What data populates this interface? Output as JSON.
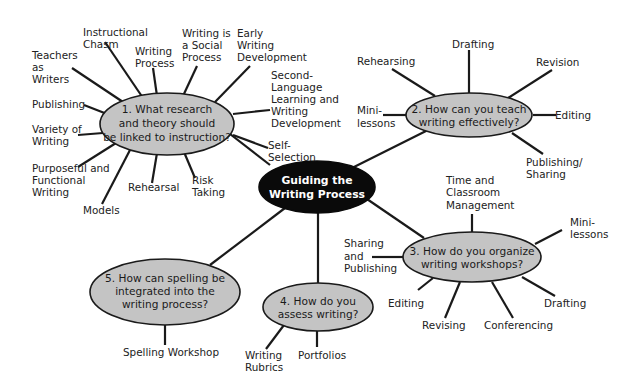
{
  "hub": {
    "line1": "Guiding the",
    "line2": "Writing Process",
    "color": "#0a0a0a"
  },
  "questions": [
    {
      "id": 1,
      "lines": [
        "1.  What research",
        "and theory should",
        "be linked to instruction?"
      ],
      "subtopics": [
        {
          "lines": [
            "Instructional",
            "Chasm"
          ]
        },
        {
          "lines": [
            "Writing",
            "Process"
          ]
        },
        {
          "lines": [
            "Writing is",
            "a Social",
            "Process"
          ]
        },
        {
          "lines": [
            "Early",
            "Writing",
            "Development"
          ]
        },
        {
          "lines": [
            "Teachers",
            "as",
            "Writers"
          ]
        },
        {
          "lines": [
            "Second-",
            "Language",
            "Learning and",
            "Writing",
            "Development"
          ]
        },
        {
          "lines": [
            "Publishing"
          ]
        },
        {
          "lines": [
            "Variety of",
            "Writing"
          ]
        },
        {
          "lines": [
            "Self-",
            "Selection"
          ]
        },
        {
          "lines": [
            "Purposeful and",
            "Functional",
            "Writing"
          ]
        },
        {
          "lines": [
            "Rehearsal"
          ]
        },
        {
          "lines": [
            "Risk",
            "Taking"
          ]
        },
        {
          "lines": [
            "Models"
          ]
        }
      ]
    },
    {
      "id": 2,
      "lines": [
        "2.  How can you teach",
        "writing effectively?"
      ],
      "subtopics": [
        {
          "lines": [
            "Drafting"
          ]
        },
        {
          "lines": [
            "Rehearsing"
          ]
        },
        {
          "lines": [
            "Revision"
          ]
        },
        {
          "lines": [
            "Mini-",
            "lessons"
          ]
        },
        {
          "lines": [
            "Editing"
          ]
        },
        {
          "lines": [
            "Publishing/",
            "Sharing"
          ]
        }
      ]
    },
    {
      "id": 3,
      "lines": [
        "3.  How do you organize",
        "writing workshops?"
      ],
      "subtopics": [
        {
          "lines": [
            "Time and",
            "Classroom",
            "Management"
          ]
        },
        {
          "lines": [
            "Mini-",
            "lessons"
          ]
        },
        {
          "lines": [
            "Sharing",
            "and",
            "Publishing"
          ]
        },
        {
          "lines": [
            "Editing"
          ]
        },
        {
          "lines": [
            "Drafting"
          ]
        },
        {
          "lines": [
            "Revising"
          ]
        },
        {
          "lines": [
            "Conferencing"
          ]
        }
      ]
    },
    {
      "id": 4,
      "lines": [
        "4.  How do you",
        "assess writing?"
      ],
      "subtopics": [
        {
          "lines": [
            "Writing",
            "Rubrics"
          ]
        },
        {
          "lines": [
            "Portfolios"
          ]
        }
      ]
    },
    {
      "id": 5,
      "lines": [
        "5.  How can spelling be",
        "integrated into the",
        "writing process?"
      ],
      "subtopics": [
        {
          "lines": [
            "Spelling Workshop"
          ]
        }
      ]
    }
  ],
  "colors": {
    "question_fill": "#c4c4c4",
    "line": "#1a1a1a",
    "hub_text": "#ffffff"
  }
}
